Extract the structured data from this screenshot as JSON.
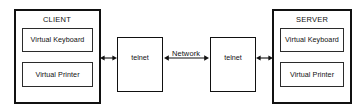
{
  "diagram": {
    "client_panel": {
      "label": "CLIENT",
      "components": [
        {
          "label": "Virtual Keyboard"
        },
        {
          "label": "Virtual Printer"
        }
      ]
    },
    "server_panel": {
      "label": "SERVER",
      "components": [
        {
          "label": "Virtual Keyboard"
        },
        {
          "label": "Virtual Printer"
        }
      ]
    },
    "nodes": [
      {
        "label": "telnet"
      },
      {
        "label": "telnet"
      }
    ],
    "links": [
      {
        "label": "",
        "style": "double-arrow"
      },
      {
        "label": "Network",
        "style": "double-arrow"
      },
      {
        "label": "",
        "style": "double-arrow"
      }
    ],
    "colors": {
      "background": "#ffffff",
      "stroke": "#111111",
      "inner_stroke": "#2b2b2b",
      "text": "#111111"
    }
  }
}
